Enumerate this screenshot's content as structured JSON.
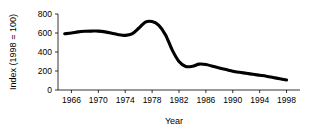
{
  "chart_data": {
    "type": "line",
    "title": "",
    "xlabel": "Year",
    "ylabel": "Index (1998 = 100)",
    "xlim": [
      1964,
      2000
    ],
    "ylim": [
      0,
      800
    ],
    "grid": false,
    "legend": false,
    "legend_position": "none",
    "line_color": "#000000",
    "xticks": [
      1966,
      1970,
      1974,
      1978,
      1982,
      1986,
      1990,
      1994,
      1998
    ],
    "xtick_labels": [
      "1966",
      "1970",
      "1974",
      "1978",
      "1982",
      "1986",
      "1990",
      "1994",
      "1998"
    ],
    "yticks": [
      0,
      200,
      400,
      600,
      800
    ],
    "ytick_labels": [
      "0",
      "200",
      "400",
      "600",
      "800"
    ],
    "series": [
      {
        "name": "Index",
        "x": [
          1965,
          1966,
          1967,
          1968,
          1969,
          1970,
          1971,
          1972,
          1973,
          1974,
          1975,
          1976,
          1977,
          1978,
          1979,
          1980,
          1981,
          1982,
          1983,
          1984,
          1985,
          1986,
          1987,
          1988,
          1989,
          1990,
          1991,
          1992,
          1993,
          1994,
          1995,
          1996,
          1997,
          1998
        ],
        "values": [
          592,
          600,
          612,
          618,
          620,
          620,
          612,
          598,
          582,
          575,
          590,
          650,
          715,
          720,
          680,
          580,
          420,
          300,
          248,
          250,
          272,
          268,
          250,
          232,
          215,
          198,
          186,
          176,
          165,
          155,
          145,
          132,
          118,
          105
        ]
      }
    ]
  }
}
